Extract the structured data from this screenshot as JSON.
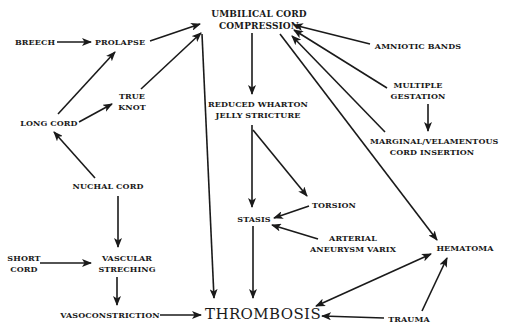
{
  "diagram": {
    "colors": {
      "background": "#ffffff",
      "ink": "#1a1a1a"
    },
    "nodes": [
      {
        "id": "compression",
        "lines": [
          "UMBILICAL CORD",
          "COMPRESSION"
        ],
        "x": 209,
        "y": 8,
        "w": 100,
        "cls": "title"
      },
      {
        "id": "breech",
        "lines": [
          "BREECH"
        ],
        "x": 12,
        "y": 37,
        "w": 46,
        "cls": ""
      },
      {
        "id": "prolapse",
        "lines": [
          "PROLAPSE"
        ],
        "x": 94,
        "y": 37,
        "w": 52,
        "cls": ""
      },
      {
        "id": "amniotic",
        "lines": [
          "AMNIOTIC BANDS"
        ],
        "x": 373,
        "y": 41,
        "w": 90,
        "cls": ""
      },
      {
        "id": "trueknot",
        "lines": [
          "TRUE",
          "KNOT"
        ],
        "x": 112,
        "y": 91,
        "w": 40,
        "cls": ""
      },
      {
        "id": "multiple",
        "lines": [
          "MULTIPLE",
          "GESTATION"
        ],
        "x": 386,
        "y": 80,
        "w": 64,
        "cls": ""
      },
      {
        "id": "wharton",
        "lines": [
          "REDUCED WHARTON",
          "JELLY STRICTURE"
        ],
        "x": 208,
        "y": 99,
        "w": 100,
        "cls": ""
      },
      {
        "id": "longcord",
        "lines": [
          "LONG CORD"
        ],
        "x": 18,
        "y": 118,
        "w": 62,
        "cls": ""
      },
      {
        "id": "marginal",
        "lines": [
          "MARGINAL/VELAMENTOUS",
          "CORD INSERTION"
        ],
        "x": 370,
        "y": 136,
        "w": 124,
        "cls": ""
      },
      {
        "id": "nuchal",
        "lines": [
          "NUCHAL CORD"
        ],
        "x": 72,
        "y": 181,
        "w": 72,
        "cls": ""
      },
      {
        "id": "torsion",
        "lines": [
          "TORSION"
        ],
        "x": 310,
        "y": 200,
        "w": 48,
        "cls": ""
      },
      {
        "id": "stasis",
        "lines": [
          "STASIS"
        ],
        "x": 236,
        "y": 214,
        "w": 36,
        "cls": ""
      },
      {
        "id": "arterial",
        "lines": [
          "ARTERIAL",
          "ANEURYSM VARIX"
        ],
        "x": 310,
        "y": 233,
        "w": 86,
        "cls": ""
      },
      {
        "id": "hematoma",
        "lines": [
          "HEMATOMA"
        ],
        "x": 434,
        "y": 243,
        "w": 62,
        "cls": ""
      },
      {
        "id": "shortcord",
        "lines": [
          "SHORT",
          "CORD"
        ],
        "x": 6,
        "y": 253,
        "w": 36,
        "cls": ""
      },
      {
        "id": "vascular",
        "lines": [
          "VASCULAR",
          "STRECHING"
        ],
        "x": 96,
        "y": 253,
        "w": 62,
        "cls": ""
      },
      {
        "id": "vasocon",
        "lines": [
          "VASOCONSTRICTION"
        ],
        "x": 58,
        "y": 310,
        "w": 104,
        "cls": ""
      },
      {
        "id": "thrombosis",
        "lines": [
          "THROMBOSIS"
        ],
        "x": 205,
        "y": 305,
        "w": 112,
        "cls": "big"
      },
      {
        "id": "trauma",
        "lines": [
          "TRAUMA"
        ],
        "x": 386,
        "y": 314,
        "w": 46,
        "cls": ""
      }
    ],
    "edges": [
      {
        "from": "breech",
        "to": "prolapse",
        "x1": 57,
        "y1": 42,
        "x2": 91,
        "y2": 42,
        "heads": "end"
      },
      {
        "from": "prolapse",
        "to": "compression",
        "x1": 150,
        "y1": 41,
        "x2": 200,
        "y2": 24,
        "heads": "end"
      },
      {
        "from": "trueknot",
        "to": "compression",
        "x1": 141,
        "y1": 89,
        "x2": 201,
        "y2": 33,
        "heads": "end"
      },
      {
        "from": "longcord",
        "to": "prolapse",
        "x1": 58,
        "y1": 114,
        "x2": 115,
        "y2": 52,
        "heads": "end"
      },
      {
        "from": "longcord",
        "to": "trueknot",
        "x1": 79,
        "y1": 122,
        "x2": 112,
        "y2": 104,
        "heads": "end"
      },
      {
        "from": "nuchal",
        "to": "longcord",
        "x1": 95,
        "y1": 178,
        "x2": 54,
        "y2": 132,
        "heads": "end"
      },
      {
        "from": "compression",
        "to": "thrombosis",
        "x1": 202,
        "y1": 34,
        "x2": 214,
        "y2": 298,
        "heads": "end"
      },
      {
        "from": "compression",
        "to": "wharton",
        "x1": 252,
        "y1": 33,
        "x2": 252,
        "y2": 94,
        "heads": "end"
      },
      {
        "from": "amniotic",
        "to": "compression",
        "x1": 370,
        "y1": 44,
        "x2": 294,
        "y2": 25,
        "heads": "end"
      },
      {
        "from": "multiple",
        "to": "compression",
        "x1": 387,
        "y1": 88,
        "x2": 294,
        "y2": 30,
        "heads": "end"
      },
      {
        "from": "marginal",
        "to": "compression",
        "x1": 385,
        "y1": 132,
        "x2": 292,
        "y2": 36,
        "heads": "end"
      },
      {
        "from": "multiple",
        "to": "marginal",
        "x1": 428,
        "y1": 104,
        "x2": 428,
        "y2": 131,
        "heads": "end"
      },
      {
        "from": "compression",
        "to": "hematoma",
        "x1": 280,
        "y1": 34,
        "x2": 437,
        "y2": 240,
        "heads": "end"
      },
      {
        "from": "wharton",
        "to": "stasis",
        "x1": 252,
        "y1": 125,
        "x2": 252,
        "y2": 207,
        "heads": "end"
      },
      {
        "from": "wharton",
        "to": "torsion",
        "x1": 253,
        "y1": 130,
        "x2": 307,
        "y2": 196,
        "heads": "end"
      },
      {
        "from": "torsion",
        "to": "stasis",
        "x1": 309,
        "y1": 206,
        "x2": 274,
        "y2": 218,
        "heads": "end"
      },
      {
        "from": "arterial",
        "to": "stasis",
        "x1": 318,
        "y1": 239,
        "x2": 272,
        "y2": 225,
        "heads": "end"
      },
      {
        "from": "stasis",
        "to": "thrombosis",
        "x1": 253,
        "y1": 226,
        "x2": 253,
        "y2": 298,
        "heads": "end"
      },
      {
        "from": "nuchal",
        "to": "vascular",
        "x1": 118,
        "y1": 196,
        "x2": 118,
        "y2": 247,
        "heads": "end"
      },
      {
        "from": "shortcord",
        "to": "vascular",
        "x1": 40,
        "y1": 263,
        "x2": 91,
        "y2": 263,
        "heads": "end"
      },
      {
        "from": "vascular",
        "to": "vasocon",
        "x1": 117,
        "y1": 277,
        "x2": 117,
        "y2": 305,
        "heads": "end"
      },
      {
        "from": "vasocon",
        "to": "thrombosis",
        "x1": 160,
        "y1": 315,
        "x2": 201,
        "y2": 315,
        "heads": "end"
      },
      {
        "from": "thrombosis",
        "to": "hematoma",
        "x1": 316,
        "y1": 306,
        "x2": 431,
        "y2": 254,
        "heads": "both"
      },
      {
        "from": "trauma",
        "to": "thrombosis",
        "x1": 384,
        "y1": 318,
        "x2": 322,
        "y2": 316,
        "heads": "end"
      },
      {
        "from": "trauma",
        "to": "hematoma",
        "x1": 422,
        "y1": 311,
        "x2": 447,
        "y2": 258,
        "heads": "end"
      }
    ]
  }
}
